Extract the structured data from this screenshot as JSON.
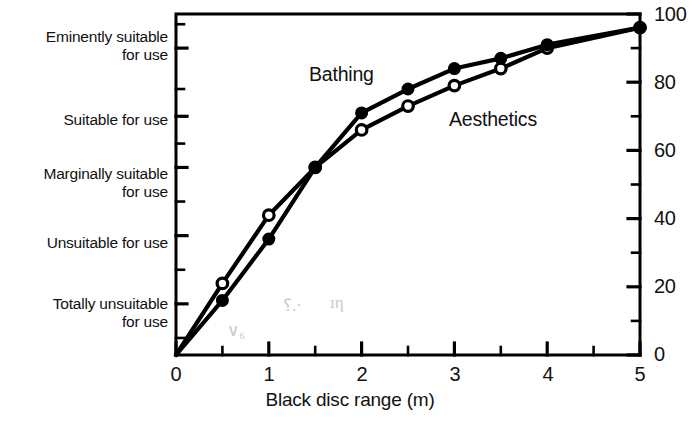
{
  "chart_data": {
    "type": "line",
    "title": "",
    "xlabel": "Black disc range (m)",
    "ylabel_right": "",
    "xlim": [
      0,
      5
    ],
    "ylim": [
      0,
      100
    ],
    "grid": false,
    "legend_position": "inline-annotations",
    "x_ticks": [
      "0",
      "1",
      "2",
      "3",
      "4",
      "5"
    ],
    "x_tick_values": [
      0,
      1,
      2,
      3,
      4,
      5
    ],
    "x_minor_ticks": [
      0.5,
      1.5,
      2.5,
      3.5,
      4.5
    ],
    "y_ticks_right": [
      "0",
      "20",
      "40",
      "60",
      "80",
      "100"
    ],
    "y_tick_values_right": [
      0,
      20,
      40,
      60,
      80,
      100
    ],
    "y_minor_ticks_right": [
      10,
      30,
      50,
      70,
      90
    ],
    "y_categories_left": [
      {
        "label": "Eminently suitable\nfor use",
        "value": 90
      },
      {
        "label": "Suitable for use",
        "value": 70
      },
      {
        "label": "Marginally suitable\nfor use",
        "value": 55
      },
      {
        "label": "Unsuitable for use",
        "value": 35
      },
      {
        "label": "Totally unsuitable\nfor use",
        "value": 15
      }
    ],
    "x": [
      0,
      0.5,
      1,
      1.5,
      2,
      2.5,
      3,
      3.5,
      4,
      5
    ],
    "series": [
      {
        "name": "Bathing",
        "marker": "filled-circle",
        "values": [
          0,
          16,
          34,
          55,
          71,
          78,
          84,
          87,
          91,
          96
        ]
      },
      {
        "name": "Aesthetics",
        "marker": "open-circle",
        "values": [
          0,
          21,
          41,
          55,
          66,
          73,
          79,
          84,
          90,
          96
        ]
      }
    ],
    "annotations": [
      {
        "text": "Bathing",
        "x": 1.45,
        "y": 84
      },
      {
        "text": "Aesthetics",
        "x": 3.0,
        "y": 71
      }
    ],
    "colors": {
      "line": "#000000",
      "marker_fill": "#000000",
      "marker_open": "#ffffff",
      "axis": "#000000"
    }
  },
  "axis_left": {
    "labels": [
      {
        "line1": "Eminently suitable",
        "line2": "for use"
      },
      {
        "line1": "Suitable for use",
        "line2": ""
      },
      {
        "line1": "Marginally suitable",
        "line2": "for use"
      },
      {
        "line1": "Unsuitable for use",
        "line2": ""
      },
      {
        "line1": "Totally unsuitable",
        "line2": "for use"
      }
    ]
  },
  "axis_right": {
    "labels": [
      "100",
      "80",
      "60",
      "40",
      "20",
      "0"
    ]
  },
  "axis_bottom": {
    "labels": [
      "0",
      "1",
      "2",
      "3",
      "4",
      "5"
    ],
    "title": "Black disc range (m)"
  },
  "series_labels": {
    "bathing": "Bathing",
    "aesthetics": "Aesthetics"
  },
  "artifacts": {
    "mark_1": "∨₆",
    "mark_2": "⸮.·",
    "mark_3": "ıη"
  }
}
